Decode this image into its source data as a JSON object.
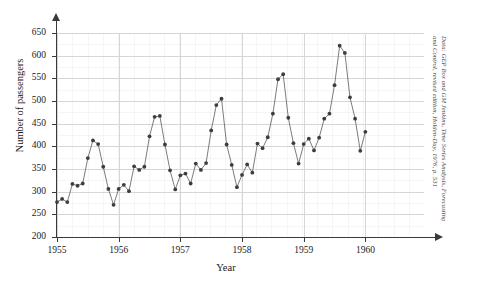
{
  "chart_data": {
    "type": "line",
    "title": "",
    "xlabel": "Year",
    "ylabel": "Number of passengers",
    "xlim": [
      1955.0,
      1960.95
    ],
    "ylim": [
      200,
      650
    ],
    "grid": true,
    "legend": false,
    "marker": "filled-circle",
    "xticks": [
      "1955",
      "1956",
      "1957",
      "1958",
      "1959",
      "1960"
    ],
    "xtick_values": [
      1955,
      1956,
      1957,
      1958,
      1959,
      1960
    ],
    "yticks": [
      "200",
      "250",
      "300",
      "350",
      "400",
      "450",
      "500",
      "550",
      "600",
      "650"
    ],
    "ytick_values": [
      200,
      250,
      300,
      350,
      400,
      450,
      500,
      550,
      600,
      650
    ],
    "series": [
      {
        "name": "International airline passengers (monthly, thousands)",
        "x": [
          1955.0,
          1955.083,
          1955.167,
          1955.25,
          1955.333,
          1955.417,
          1955.5,
          1955.583,
          1955.667,
          1955.75,
          1955.833,
          1955.917,
          1956.0,
          1956.083,
          1956.167,
          1956.25,
          1956.333,
          1956.417,
          1956.5,
          1956.583,
          1956.667,
          1956.75,
          1956.833,
          1956.917,
          1957.0,
          1957.083,
          1957.167,
          1957.25,
          1957.333,
          1957.417,
          1957.5,
          1957.583,
          1957.667,
          1957.75,
          1957.833,
          1957.917,
          1958.0,
          1958.083,
          1958.167,
          1958.25,
          1958.333,
          1958.417,
          1958.5,
          1958.583,
          1958.667,
          1958.75,
          1958.833,
          1958.917,
          1959.0,
          1959.083,
          1959.167,
          1959.25,
          1959.333,
          1959.417,
          1959.5,
          1959.583,
          1959.667,
          1959.75,
          1959.833,
          1959.917,
          1960.0,
          1960.083,
          1960.167,
          1960.25,
          1960.333,
          1960.417,
          1960.5,
          1960.583,
          1960.667,
          1960.75,
          1960.833,
          1960.917
        ],
        "values": [
          277,
          284,
          277,
          317,
          313,
          318,
          374,
          413,
          405,
          355,
          306,
          271,
          306,
          315,
          301,
          356,
          348,
          355,
          422,
          465,
          467,
          404,
          347,
          305,
          336,
          340,
          318,
          362,
          348,
          363,
          435,
          491,
          505,
          404,
          359,
          310,
          337,
          360,
          342,
          406,
          396,
          420,
          472,
          548,
          559,
          463,
          407,
          362,
          405,
          417,
          391,
          419,
          461,
          472,
          535,
          622,
          606,
          508,
          461,
          390,
          432,
          432,
          432,
          432,
          432,
          432,
          432,
          432,
          432,
          432,
          432,
          432
        ]
      }
    ],
    "annotations": {
      "credit": "Data: GEP Box and GM Jenkins, Time Series Analysis, Forecasting and Control, revised edition, Holden-Day, 1976, p. 531"
    },
    "colors": {
      "line": "#5a5a5a",
      "marker": "#3d3d3d",
      "grid": "#d6d6da",
      "minor_grid": "#eeeef1",
      "axis": "#3a3a3a",
      "text": "#1a1a1a",
      "background": "#ffffff"
    }
  }
}
